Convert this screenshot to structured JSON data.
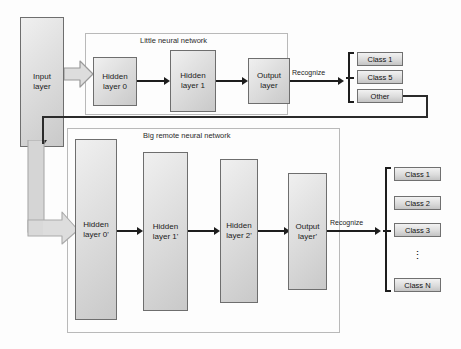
{
  "diagram": {
    "type": "flow-diagram",
    "colors": {
      "node_fill_light": "#f0f0f0",
      "node_fill_dark": "#c9c9c9",
      "node_border": "#6e6e6e",
      "frame_border": "#b9b9b9",
      "connector": "#1d1d1d",
      "block_arrow_fill": "#d9d9d9",
      "block_arrow_border": "#9a9a9a",
      "background": "#fdfdfd"
    }
  },
  "input": {
    "label_line1": "Input",
    "label_line2": "layer"
  },
  "little_network": {
    "frame_title": "Little neural network",
    "nodes": [
      {
        "label_line1": "Hidden",
        "label_line2": "layer 0"
      },
      {
        "label_line1": "Hidden",
        "label_line2": "layer 1"
      },
      {
        "label_line1": "Output",
        "label_line2": "layer"
      }
    ],
    "output_edge_label": "Recognize",
    "classes": [
      "Class 1",
      "Class 5",
      "Other"
    ]
  },
  "big_network": {
    "frame_title": "Big remote neural network",
    "nodes": [
      {
        "label_line1": "Hidden",
        "label_line2": "layer 0'"
      },
      {
        "label_line1": "Hidden",
        "label_line2": "layer 1'"
      },
      {
        "label_line1": "Hidden",
        "label_line2": "layer 2'"
      },
      {
        "label_line1": "Output",
        "label_line2": "layer'"
      }
    ],
    "output_edge_label": "Recognize",
    "classes": [
      "Class 1",
      "Class 2",
      "Class 3",
      "Class N"
    ],
    "ellipsis": "⋮"
  }
}
